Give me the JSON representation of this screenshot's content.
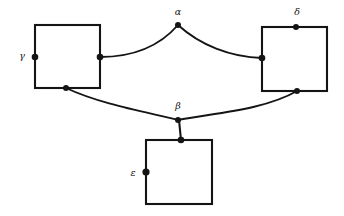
{
  "figure": {
    "kind": "graph-diagram",
    "width": 344,
    "height": 216,
    "background_color": "#ffffff",
    "ink_color": "#141414"
  },
  "labels": {
    "alpha": "α",
    "beta": "β",
    "gamma": "γ",
    "delta": "δ",
    "epsilon": "ε"
  },
  "label_positions": {
    "alpha": {
      "x": 178,
      "y": 12
    },
    "beta": {
      "x": 178,
      "y": 106
    },
    "gamma": {
      "x": 22,
      "y": 56
    },
    "delta": {
      "x": 297,
      "y": 12
    },
    "epsilon": {
      "x": 133,
      "y": 173
    }
  },
  "squares": [
    {
      "name": "left-square",
      "label": "γ",
      "x": 35,
      "y": 25,
      "width": 65,
      "height": 63
    },
    {
      "name": "right-square",
      "label": "δ",
      "x": 262,
      "y": 27,
      "width": 65,
      "height": 64
    },
    {
      "name": "bottom-square",
      "label": "ε",
      "x": 146,
      "y": 140,
      "width": 66,
      "height": 64
    }
  ],
  "vertices": [
    {
      "name": "alpha-node",
      "x": 178,
      "y": 25,
      "r": 3.0
    },
    {
      "name": "beta-node",
      "x": 178,
      "y": 120,
      "r": 3.0
    },
    {
      "name": "gamma-node",
      "x": 35,
      "y": 57,
      "r": 3.3
    },
    {
      "name": "delta-node",
      "x": 296,
      "y": 27,
      "r": 3.0
    },
    {
      "name": "epsilon-node",
      "x": 146,
      "y": 172,
      "r": 3.6
    },
    {
      "name": "left-square-right-node",
      "x": 100,
      "y": 57,
      "r": 3.3
    },
    {
      "name": "left-square-bottom-node",
      "x": 66,
      "y": 88,
      "r": 3.0
    },
    {
      "name": "right-square-left-node",
      "x": 262,
      "y": 58,
      "r": 3.3
    },
    {
      "name": "right-square-bottom-node",
      "x": 297,
      "y": 91,
      "r": 3.0
    },
    {
      "name": "bottom-square-top-node",
      "x": 181,
      "y": 140,
      "r": 3.3
    }
  ],
  "arcs": [
    {
      "name": "arc-left-square-to-alpha",
      "from": "left-square-right-node",
      "to": "alpha-node",
      "path": "M 100 57 C 130 57 158 48 178 25"
    },
    {
      "name": "arc-alpha-to-right-square",
      "from": "alpha-node",
      "to": "right-square-left-node",
      "path": "M 178 25 C 200 45 230 57 262 58"
    },
    {
      "name": "arc-left-square-to-beta",
      "from": "left-square-bottom-node",
      "to": "beta-node",
      "path": "M 66 88 C 100 104 146 112 178 120"
    },
    {
      "name": "arc-beta-to-right-square",
      "from": "beta-node",
      "to": "right-square-bottom-node",
      "path": "M 178 120 C 214 113 264 110 297 91"
    }
  ],
  "connectors": [
    {
      "name": "connector-beta-to-bottom-square",
      "from": "beta-node",
      "to": "bottom-square-top-node",
      "x1": 179,
      "y1": 120,
      "x2": 181,
      "y2": 140
    }
  ]
}
